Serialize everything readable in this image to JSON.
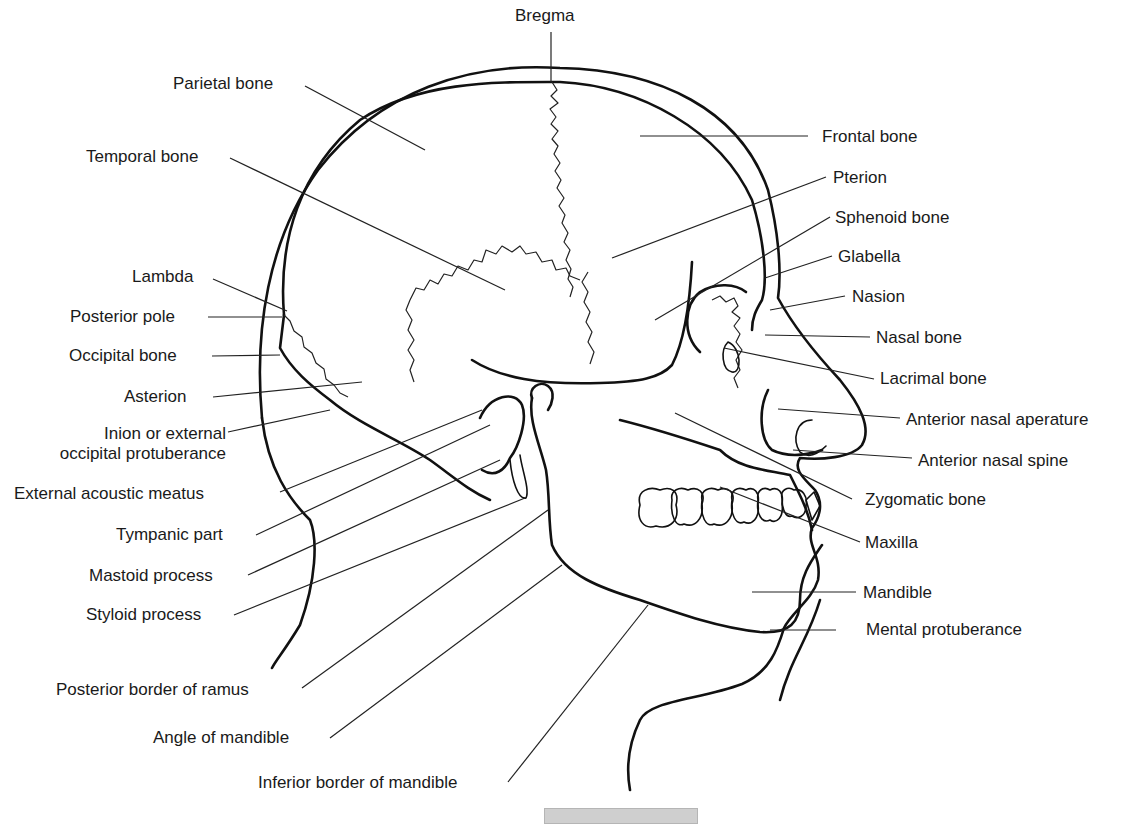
{
  "figure": {
    "caption": {
      "text": "",
      "truncated": true
    }
  },
  "labels": {
    "bregma": "Bregma",
    "parietal_bone": "Parietal bone",
    "temporal_bone": "Temporal bone",
    "frontal_bone": "Frontal bone",
    "pterion": "Pterion",
    "sphenoid_bone": "Sphenoid bone",
    "glabella": "Glabella",
    "lambda": "Lambda",
    "posterior_pole": "Posterior pole",
    "occipital_bone": "Occipital bone",
    "asterion": "Asterion",
    "inion_line1": "Inion or external",
    "inion_line2": "occipital protuberance",
    "nasion": "Nasion",
    "nasal_bone": "Nasal bone",
    "lacrimal_bone": "Lacrimal bone",
    "anterior_nasal_aperature": "Anterior nasal aperature",
    "anterior_nasal_spine": "Anterior nasal spine",
    "external_acoustic_meatus": "External acoustic meatus",
    "tympanic_part": "Tympanic part",
    "zygomatic_bone": "Zygomatic bone",
    "maxilla": "Maxilla",
    "mastoid_process": "Mastoid process",
    "styloid_process": "Styloid process",
    "mandible": "Mandible",
    "mental_protuberance": "Mental protuberance",
    "posterior_border_of_ramus": "Posterior border of ramus",
    "angle_of_mandible": "Angle of mandible",
    "inferior_border_of_mandible": "Inferior border of mandible"
  },
  "colors": {
    "line": "#111111",
    "background": "#ffffff",
    "caption_box": "#cfcfcf"
  }
}
